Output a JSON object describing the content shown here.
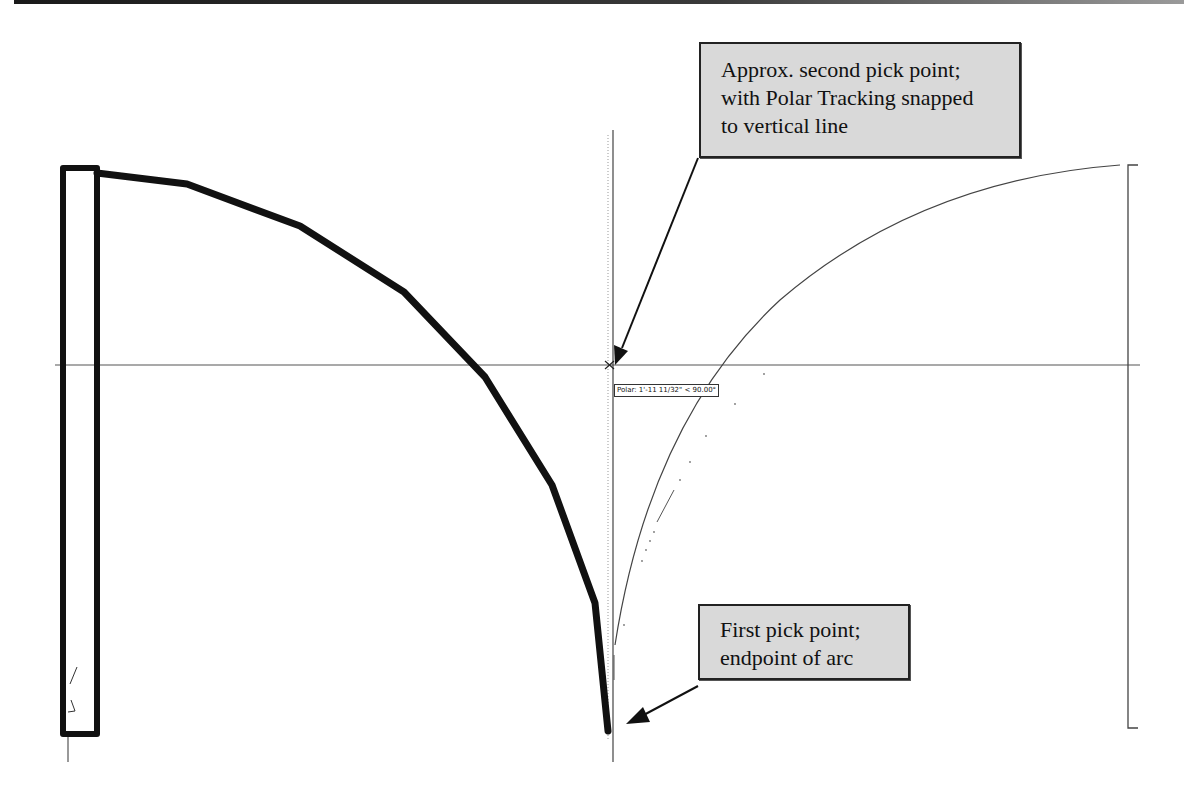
{
  "window": {
    "type": "CAD drawing viewport (AutoCAD-style arc construction illustration)"
  },
  "callouts": {
    "second_pick": {
      "lines": [
        "Approx. second pick point;",
        "with Polar Tracking snapped",
        "to vertical line"
      ]
    },
    "first_pick": {
      "lines": [
        "First pick point;",
        "endpoint of arc"
      ]
    }
  },
  "tooltip": {
    "polar_label": "Polar: 1'-11 11/32\" < 90.00°"
  },
  "drawing": {
    "colors": {
      "thick_outline": "#111111",
      "thin_line": "#444444",
      "crosshair": "#555555",
      "callout_fill": "#d9d9d9",
      "callout_border": "#222222"
    },
    "polar_angle_deg": 90.0,
    "polar_distance": "1'-11 11/32\""
  }
}
